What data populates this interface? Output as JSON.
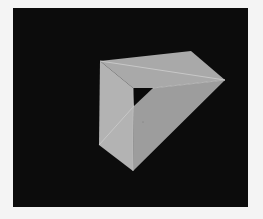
{
  "scene": {
    "description": "3D render of a triangular-prism frame (hollow wedge) in light grey against a black background",
    "colors": {
      "page": "#f4f4f4",
      "background": "#0c0c0c",
      "top_face": "#a9a9a9",
      "left_face": "#b4b4b4",
      "front_face": "#9c9c9c",
      "hole": "#0a0a0a",
      "edge_highlight": "#cfcfcf"
    },
    "vertices": {
      "top_left": [
        100,
        61
      ],
      "top_back": [
        191,
        51
      ],
      "right": [
        225,
        80
      ],
      "inner_top_left": [
        133,
        88
      ],
      "inner_top_right": [
        153,
        88
      ],
      "inner_bottom": [
        134,
        106
      ],
      "bottom_left": [
        99,
        145
      ],
      "bottom": [
        133,
        171
      ]
    }
  }
}
